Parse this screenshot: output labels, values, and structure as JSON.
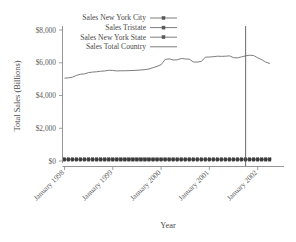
{
  "chart_data": {
    "type": "line",
    "title": "",
    "xlabel": "Year",
    "ylabel": "Total Sales (Billions)",
    "ylim": [
      0,
      8000
    ],
    "ytick_labels": [
      "$0",
      "$2,000",
      "$4,000",
      "$6,000",
      "$8,000"
    ],
    "ytick_values": [
      0,
      2000,
      4000,
      6000,
      8000
    ],
    "xtick_labels": [
      "January 1998",
      "January 1999",
      "January 2000",
      "January 2001",
      "January 2002"
    ],
    "xtick_values": [
      0,
      12,
      24,
      36,
      48
    ],
    "grid": false,
    "legend_position": "upper-left",
    "x": [
      0,
      1,
      2,
      3,
      4,
      5,
      6,
      7,
      8,
      9,
      10,
      11,
      12,
      13,
      14,
      15,
      16,
      17,
      18,
      19,
      20,
      21,
      22,
      23,
      24,
      25,
      26,
      27,
      28,
      29,
      30,
      31,
      32,
      33,
      34,
      35,
      36,
      37,
      38,
      39,
      40,
      41,
      42,
      43,
      44,
      45,
      46,
      47,
      48,
      49,
      50,
      51
    ],
    "series": [
      {
        "name": "Sales New York City",
        "marker": "dot",
        "values": [
          60,
          60,
          60,
          60,
          60,
          60,
          60,
          60,
          60,
          60,
          60,
          60,
          60,
          60,
          60,
          60,
          60,
          60,
          60,
          60,
          60,
          60,
          60,
          60,
          60,
          60,
          60,
          60,
          60,
          60,
          60,
          60,
          60,
          60,
          60,
          60,
          60,
          60,
          60,
          60,
          60,
          60,
          60,
          60,
          60,
          60,
          60,
          60,
          60,
          60,
          60,
          60
        ]
      },
      {
        "name": "Sales Tristate",
        "marker": "dot",
        "values": [
          95,
          95,
          95,
          95,
          95,
          95,
          95,
          95,
          95,
          95,
          95,
          95,
          95,
          95,
          95,
          95,
          95,
          95,
          95,
          95,
          95,
          95,
          95,
          95,
          95,
          95,
          95,
          95,
          95,
          95,
          95,
          95,
          95,
          95,
          95,
          95,
          95,
          95,
          95,
          95,
          95,
          95,
          95,
          95,
          95,
          95,
          95,
          95,
          95,
          95,
          95,
          95
        ]
      },
      {
        "name": "Sales New York State",
        "marker": "dot",
        "values": [
          130,
          130,
          130,
          130,
          130,
          130,
          130,
          130,
          130,
          130,
          130,
          130,
          130,
          130,
          130,
          130,
          130,
          130,
          130,
          130,
          130,
          130,
          130,
          130,
          130,
          130,
          130,
          130,
          130,
          130,
          130,
          130,
          130,
          130,
          130,
          130,
          130,
          130,
          130,
          130,
          130,
          130,
          130,
          130,
          130,
          130,
          130,
          130,
          130,
          130,
          130,
          130
        ]
      },
      {
        "name": "Sales Total Country",
        "marker": "none",
        "values": [
          5060,
          5080,
          5120,
          5230,
          5300,
          5320,
          5400,
          5430,
          5450,
          5480,
          5500,
          5540,
          5530,
          5500,
          5510,
          5510,
          5520,
          5530,
          5540,
          5560,
          5580,
          5620,
          5700,
          5780,
          5880,
          6200,
          6240,
          6170,
          6180,
          6260,
          6230,
          6220,
          6050,
          6040,
          6080,
          6340,
          6350,
          6370,
          6400,
          6390,
          6400,
          6420,
          6310,
          6300,
          6360,
          6420,
          6460,
          6440,
          6300,
          6190,
          6040,
          5950
        ]
      }
    ],
    "annotations": [
      {
        "type": "vertical-line",
        "x": 45,
        "label": ""
      }
    ]
  },
  "legend": {
    "items": [
      {
        "label": "Sales New York City",
        "marker": "dot"
      },
      {
        "label": "Sales Tristate",
        "marker": "dot"
      },
      {
        "label": "Sales New York State",
        "marker": "dot"
      },
      {
        "label": "Sales Total Country",
        "marker": "none"
      }
    ]
  }
}
